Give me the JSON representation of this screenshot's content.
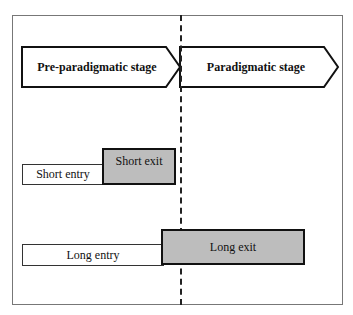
{
  "stages": [
    {
      "label": "Pre-paradigmatic stage"
    },
    {
      "label": "Paradigmatic stage"
    }
  ],
  "bars": {
    "short_entry": "Short entry",
    "short_exit": "Short exit",
    "long_entry": "Long entry",
    "long_exit": "Long exit"
  },
  "colors": {
    "exit_fill": "#bdbdbd",
    "entry_fill": "#ffffff"
  }
}
